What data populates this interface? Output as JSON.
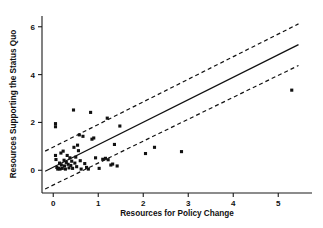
{
  "chart_data": {
    "type": "scatter",
    "title": "",
    "xlabel": "Resources for Policy Change",
    "ylabel": "Resources Supporting the Status Quo",
    "xlim": [
      -0.25,
      5.75
    ],
    "ylim": [
      -0.95,
      6.45
    ],
    "xticks": [
      0,
      1,
      2,
      3,
      4,
      5
    ],
    "xticklabels": [
      "0",
      "1",
      "2",
      "3",
      "4",
      "5"
    ],
    "yticks": [
      0,
      2,
      4,
      6
    ],
    "yticklabels": [
      "0",
      "2",
      "4",
      "6"
    ],
    "grid": false,
    "legend": null,
    "marker": "filled-square",
    "marker_color": "#111111",
    "points": [
      [
        0.05,
        1.95
      ],
      [
        0.05,
        1.82
      ],
      [
        0.05,
        0.62
      ],
      [
        0.06,
        0.45
      ],
      [
        0.08,
        0.12
      ],
      [
        0.1,
        0.05
      ],
      [
        0.12,
        0.08
      ],
      [
        0.14,
        0.3
      ],
      [
        0.15,
        0.05
      ],
      [
        0.17,
        0.72
      ],
      [
        0.18,
        0.22
      ],
      [
        0.2,
        0.08
      ],
      [
        0.22,
        0.8
      ],
      [
        0.24,
        0.42
      ],
      [
        0.25,
        0.18
      ],
      [
        0.27,
        0.05
      ],
      [
        0.29,
        0.33
      ],
      [
        0.31,
        0.62
      ],
      [
        0.33,
        0.25
      ],
      [
        0.35,
        0.1
      ],
      [
        0.37,
        0.52
      ],
      [
        0.39,
        0.2
      ],
      [
        0.41,
        0.38
      ],
      [
        0.43,
        0.08
      ],
      [
        0.45,
        2.52
      ],
      [
        0.46,
        0.96
      ],
      [
        0.48,
        0.3
      ],
      [
        0.5,
        0.55
      ],
      [
        0.52,
        0.15
      ],
      [
        0.54,
        1.05
      ],
      [
        0.56,
        0.82
      ],
      [
        0.58,
        1.48
      ],
      [
        0.6,
        0.4
      ],
      [
        0.62,
        0.05
      ],
      [
        0.66,
        1.42
      ],
      [
        0.7,
        0.28
      ],
      [
        0.74,
        0.12
      ],
      [
        0.78,
        0.05
      ],
      [
        0.83,
        2.42
      ],
      [
        0.86,
        1.3
      ],
      [
        0.9,
        1.35
      ],
      [
        0.94,
        0.52
      ],
      [
        1.02,
        0.08
      ],
      [
        1.1,
        0.46
      ],
      [
        1.16,
        0.5
      ],
      [
        1.2,
        2.18
      ],
      [
        1.22,
        0.44
      ],
      [
        1.28,
        0.22
      ],
      [
        1.32,
        0.26
      ],
      [
        1.36,
        1.08
      ],
      [
        1.42,
        0.18
      ],
      [
        1.48,
        1.85
      ],
      [
        2.05,
        0.7
      ],
      [
        2.25,
        0.96
      ],
      [
        2.85,
        0.78
      ],
      [
        5.3,
        3.35
      ]
    ],
    "fit_line": {
      "label": "regression line",
      "x": [
        -0.18,
        5.45
      ],
      "y": [
        -0.04,
        5.25
      ]
    },
    "confidence_bands": [
      {
        "label": "upper band",
        "style": "dashed",
        "x": [
          -0.18,
          5.45
        ],
        "y": [
          0.8,
          6.12
        ]
      },
      {
        "label": "lower band",
        "style": "dashed",
        "x": [
          -0.18,
          5.45
        ],
        "y": [
          -0.78,
          4.38
        ]
      }
    ]
  }
}
